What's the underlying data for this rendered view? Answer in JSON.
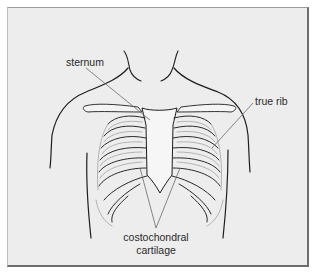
{
  "diagram": {
    "labels": {
      "sternum": "sternum",
      "true_rib": "true rib",
      "costochondral_line1": "costochondral",
      "costochondral_line2": "cartilage"
    },
    "colors": {
      "background": "#ededed",
      "outline": "#1e1e1e",
      "bone": "#f4f4f4",
      "leader_line": "#6a6a6a",
      "text": "#2a2a2a"
    }
  }
}
